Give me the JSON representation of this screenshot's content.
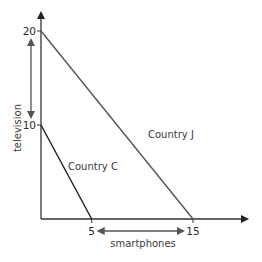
{
  "chart_data": {
    "type": "line",
    "title": "",
    "xlabel": "smartphones",
    "ylabel": "television",
    "xlim": [
      0,
      15
    ],
    "ylim": [
      0,
      20
    ],
    "x_ticks": [
      5,
      15
    ],
    "y_ticks": [
      10,
      20
    ],
    "grid": false,
    "series": [
      {
        "name": "Country J",
        "label": "Country J",
        "x": [
          0,
          15
        ],
        "y": [
          20,
          0
        ],
        "color": "#555555"
      },
      {
        "name": "Country C",
        "label": "Country C",
        "x": [
          0,
          5
        ],
        "y": [
          10,
          0
        ],
        "color": "#1e1e1e"
      }
    ],
    "annotations": [
      {
        "type": "double-arrow",
        "axis": "y",
        "from": 10,
        "to": 20,
        "description": "difference in television output"
      },
      {
        "type": "double-arrow",
        "axis": "x",
        "from": 5,
        "to": 15,
        "description": "difference in smartphones output"
      }
    ]
  }
}
